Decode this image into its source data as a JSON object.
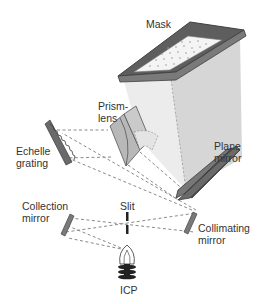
{
  "diagram": {
    "type": "optical-schematic",
    "colors": {
      "mirror_dark": "#6b6b6b",
      "mirror_edge": "#444444",
      "box_light": "#ececec",
      "box_side": "#c9c9c9",
      "prism": "#b5b5b5",
      "ray": "#8a8a8a",
      "text": "#333333"
    },
    "labels": {
      "mask": "Mask",
      "prism_lens_1": "Prism-",
      "prism_lens_2": "lens",
      "echelle_1": "Echelle",
      "echelle_2": "grating",
      "plane_1": "Plane",
      "plane_2": "mirror",
      "collection_1": "Collection",
      "collection_2": "mirror",
      "slit": "Slit",
      "collimating_1": "Collimating",
      "collimating_2": "mirror",
      "icp": "ICP"
    },
    "components": [
      "Mask",
      "Prism-lens",
      "Echelle grating",
      "Plane mirror",
      "Collection mirror",
      "Slit",
      "Collimating mirror",
      "ICP"
    ]
  }
}
